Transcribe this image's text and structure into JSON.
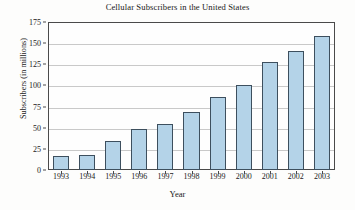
{
  "chart_data": {
    "type": "bar",
    "title": "Cellular Subscribers in the United States",
    "xlabel": "Year",
    "ylabel": "Subscribers (in millions)",
    "categories": [
      "1993",
      "1994",
      "1995",
      "1996",
      "1997",
      "1998",
      "1999",
      "2000",
      "2001",
      "2002",
      "2003"
    ],
    "values": [
      16,
      18,
      34,
      48,
      55,
      69,
      86,
      101,
      128,
      141,
      159
    ],
    "series": [
      {
        "name": "Subscribers (in millions)",
        "values": [
          16,
          18,
          34,
          48,
          55,
          69,
          86,
          101,
          128,
          141,
          159
        ]
      }
    ],
    "ylim": [
      0,
      175
    ],
    "yticks": [
      0,
      25,
      50,
      75,
      100,
      125,
      150,
      175
    ],
    "ytick_labels": [
      "0",
      "25",
      "50",
      "75",
      "100",
      "125",
      "150",
      "175"
    ],
    "xtick_labels": [
      "1993",
      "1994",
      "1995",
      "1996",
      "1997",
      "1998",
      "1999",
      "2000",
      "2001",
      "2002",
      "2003"
    ],
    "grid": "horizontal",
    "legend": "none",
    "bar_fill_color": "#b4d3e8",
    "bar_edge_color": "#3d4f5e",
    "gridline_color": "#c9c9c9",
    "axis_color": "#4a4a4a",
    "text_color": "#1a1a1a",
    "background_color": "#fdfdfc"
  }
}
